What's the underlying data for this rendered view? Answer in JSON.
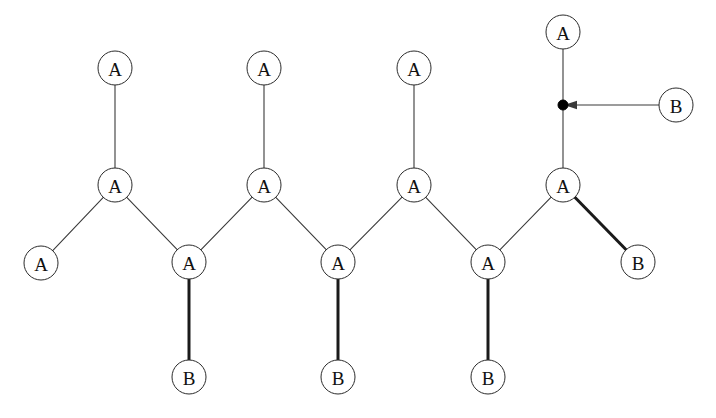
{
  "diagram": {
    "background_color": "#ffffff",
    "stroke_color": "#2b2b2b",
    "bold_stroke_color": "#1a1a1a",
    "node_radius": 17,
    "nodes": [
      {
        "id": "a_top_1",
        "label": "A",
        "x": 115,
        "y": 68,
        "type": "circle"
      },
      {
        "id": "a_top_2",
        "label": "A",
        "x": 264,
        "y": 68,
        "type": "circle"
      },
      {
        "id": "a_top_3",
        "label": "A",
        "x": 414,
        "y": 68,
        "type": "circle"
      },
      {
        "id": "a_top_4",
        "label": "A",
        "x": 563,
        "y": 32,
        "type": "circle"
      },
      {
        "id": "a_mid_1",
        "label": "A",
        "x": 115,
        "y": 185,
        "type": "circle"
      },
      {
        "id": "a_mid_2",
        "label": "A",
        "x": 264,
        "y": 185,
        "type": "circle"
      },
      {
        "id": "a_mid_3",
        "label": "A",
        "x": 414,
        "y": 185,
        "type": "circle"
      },
      {
        "id": "a_mid_4",
        "label": "A",
        "x": 563,
        "y": 185,
        "type": "circle"
      },
      {
        "id": "a_left_end",
        "label": "A",
        "x": 41,
        "y": 263,
        "type": "circle"
      },
      {
        "id": "a_low_1",
        "label": "A",
        "x": 189,
        "y": 262,
        "type": "circle"
      },
      {
        "id": "a_low_2",
        "label": "A",
        "x": 338,
        "y": 262,
        "type": "circle"
      },
      {
        "id": "a_low_3",
        "label": "A",
        "x": 488,
        "y": 262,
        "type": "circle"
      },
      {
        "id": "b_right_end",
        "label": "B",
        "x": 638,
        "y": 262,
        "type": "circle"
      },
      {
        "id": "b_bot_1",
        "label": "B",
        "x": 189,
        "y": 377,
        "type": "circle"
      },
      {
        "id": "b_bot_2",
        "label": "B",
        "x": 338,
        "y": 377,
        "type": "circle"
      },
      {
        "id": "b_bot_3",
        "label": "B",
        "x": 488,
        "y": 377,
        "type": "circle"
      },
      {
        "id": "b_callout",
        "label": "B",
        "x": 676,
        "y": 105,
        "type": "circle"
      }
    ],
    "attachment_point": {
      "id": "attach_dot",
      "x": 563,
      "y": 105,
      "radius": 5
    },
    "bonds": [
      {
        "from": "a_top_1",
        "to": "a_mid_1",
        "style": "thin"
      },
      {
        "from": "a_top_2",
        "to": "a_mid_2",
        "style": "thin"
      },
      {
        "from": "a_top_3",
        "to": "a_mid_3",
        "style": "thin"
      },
      {
        "from": "a_top_4",
        "to": "a_mid_4",
        "style": "thin"
      },
      {
        "from": "a_mid_1",
        "to": "a_left_end",
        "style": "thin"
      },
      {
        "from": "a_mid_1",
        "to": "a_low_1",
        "style": "thin"
      },
      {
        "from": "a_low_1",
        "to": "a_mid_2",
        "style": "thin"
      },
      {
        "from": "a_mid_2",
        "to": "a_low_2",
        "style": "thin"
      },
      {
        "from": "a_low_2",
        "to": "a_mid_3",
        "style": "thin"
      },
      {
        "from": "a_mid_3",
        "to": "a_low_3",
        "style": "thin"
      },
      {
        "from": "a_low_3",
        "to": "a_mid_4",
        "style": "thin"
      },
      {
        "from": "a_mid_4",
        "to": "b_right_end",
        "style": "bold"
      },
      {
        "from": "a_low_1",
        "to": "b_bot_1",
        "style": "bold"
      },
      {
        "from": "a_low_2",
        "to": "b_bot_2",
        "style": "bold"
      },
      {
        "from": "a_low_3",
        "to": "b_bot_3",
        "style": "bold"
      }
    ],
    "callout_arrow": {
      "from": "b_callout",
      "to": "attach_dot",
      "start_x": 659,
      "start_y": 105,
      "end_x": 573,
      "end_y": 105,
      "direction": "left"
    }
  }
}
